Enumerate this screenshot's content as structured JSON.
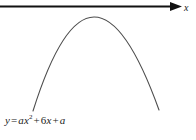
{
  "figure": {
    "width": 196,
    "height": 140,
    "background_color": "#ffffff",
    "axis": {
      "name": "x-axis",
      "orientation": "horizontal",
      "label": "x",
      "arrow_direction": "right",
      "color": "#111111",
      "start_x": 0,
      "end_x": 182,
      "y": 6.5,
      "thickness": 2.2
    },
    "curve": {
      "name": "parabola",
      "color": "#4d4d4d",
      "thickness": 1.1,
      "opens": "down",
      "vertex_px": [
        94,
        17
      ],
      "left_end_px": [
        33,
        111
      ],
      "right_end_px": [
        159,
        110
      ]
    },
    "equation": {
      "full_text": "y = ax² + 6x + a",
      "lhs": "y",
      "equals": "=",
      "term1_coefficient": "a",
      "term1_variable": "x",
      "term1_exponent": "2",
      "plus1": "+",
      "term2_coefficient": "6",
      "term2_variable": "x",
      "plus2": "+",
      "term3": "a"
    }
  },
  "chart_data": {
    "type": "line",
    "title": "",
    "subtitle": "",
    "xlabel": "x",
    "ylabel": "",
    "grid": false,
    "legend": "none",
    "annotations": [
      "y = ax² + 6x + a"
    ],
    "curves": [
      {
        "name": "parabola",
        "equation": "y = ax^2 + 6x + a",
        "opens": "down",
        "description": "Downward-opening parabola whose vertex lies below the x-axis; the curve does not intersect the x-axis.",
        "vertex_px": [
          94,
          17
        ],
        "x_px": [
          33,
          40,
          48,
          56,
          64,
          72,
          80,
          86,
          94,
          102,
          110,
          118,
          126,
          134,
          142,
          150,
          159
        ],
        "y_px": [
          111,
          96,
          79,
          65,
          52,
          40,
          30,
          24,
          17,
          19,
          25,
          34,
          46,
          60,
          76,
          93,
          110
        ]
      }
    ],
    "axes": [
      {
        "name": "x-axis",
        "label": "x",
        "arrow": "right",
        "y_px": 6.5,
        "x_range_px": [
          0,
          182
        ]
      }
    ]
  }
}
